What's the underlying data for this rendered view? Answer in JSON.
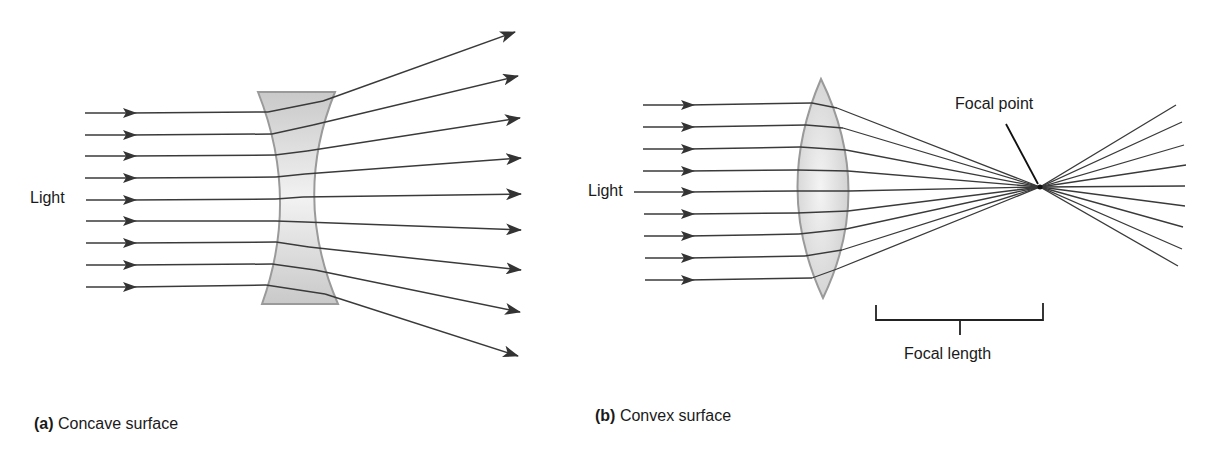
{
  "panels": [
    {
      "id": "a",
      "letter": "(a)",
      "caption": "Concave surface",
      "light_label": "Light",
      "lens_type": "concave",
      "ray_count": 9
    },
    {
      "id": "b",
      "letter": "(b)",
      "caption": "Convex surface",
      "light_label": "Light",
      "lens_type": "convex",
      "ray_count": 9,
      "focal_point_label": "Focal point",
      "focal_length_label": "Focal length"
    }
  ],
  "colors": {
    "ray": "#3a3a3a",
    "lens_fill": "#d6d6d6",
    "lens_edge": "#9a9a9a",
    "text": "#1a1a1a"
  }
}
